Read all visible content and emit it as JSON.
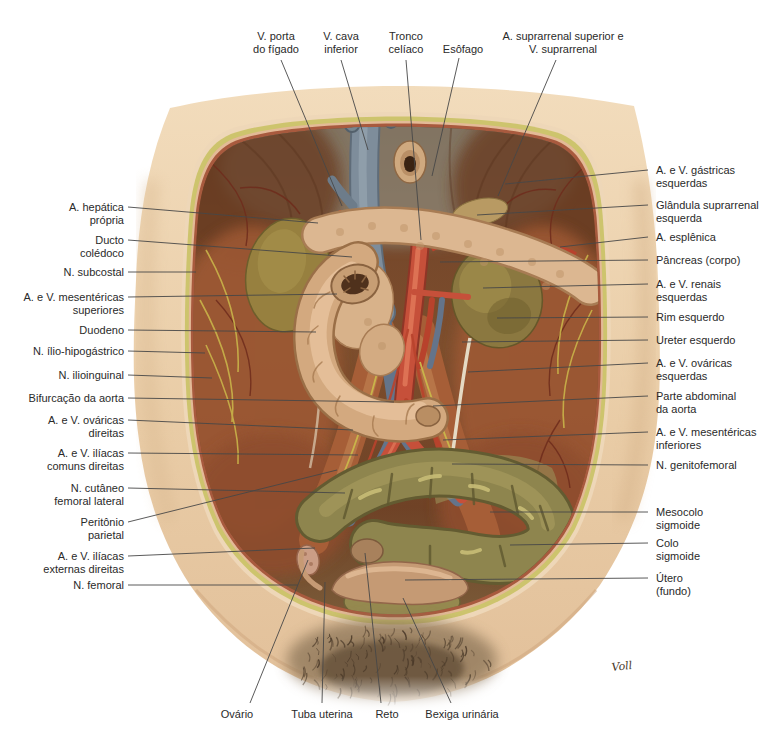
{
  "figure": {
    "signature": "Voll",
    "palette": {
      "background": "#ffffff",
      "label_text": "#2a2a2a",
      "leader_line": "#474747",
      "skin": "#ecd0ac",
      "fat_layer": "#cdc46d",
      "muscle_wall": "#a85a3e",
      "cavity": "#74482a",
      "artery": "#c6503a",
      "vein": "#7e8d9b",
      "nerve": "#c9b44a",
      "pancreas": "#dcb791",
      "duodenum": "#d3a97f",
      "kidney": "#8b7840",
      "colon": "#8e854e",
      "uterus": "#c59a74"
    }
  },
  "labels": {
    "top": [
      {
        "text": "V. porta\ndo fígado"
      },
      {
        "text": "V. cava\ninferior"
      },
      {
        "text": "Tronco\ncelíaco"
      },
      {
        "text": "Esôfago"
      },
      {
        "text": "A. suprarrenal superior e\nV. suprarrenal"
      }
    ],
    "left": [
      {
        "text": "A. hepática\nprópria"
      },
      {
        "text": "Ducto\ncolédoco"
      },
      {
        "text": "N. subcostal"
      },
      {
        "text": "A. e V. mesentéricas\nsuperiores"
      },
      {
        "text": "Duodeno"
      },
      {
        "text": "N. ílio-hipogástrico"
      },
      {
        "text": "N. ilioinguinal"
      },
      {
        "text": "Bifurcação da aorta"
      },
      {
        "text": "A. e V. ováricas\ndireitas"
      },
      {
        "text": "A. e V. ilíacas\ncomuns direitas"
      },
      {
        "text": "N. cutâneo\nfemoral lateral"
      },
      {
        "text": "Peritônio\nparietal"
      },
      {
        "text": "A. e V. ilíacas\nexternas direitas"
      },
      {
        "text": "N. femoral"
      }
    ],
    "right": [
      {
        "text": "A. e V. gástricas\nesquerdas"
      },
      {
        "text": "Glândula suprarrenal\nesquerda"
      },
      {
        "text": "A. esplênica"
      },
      {
        "text": "Pâncreas (corpo)"
      },
      {
        "text": "A. e V. renais\nesquerdas"
      },
      {
        "text": "Rim esquerdo"
      },
      {
        "text": "Ureter esquerdo"
      },
      {
        "text": "A. e V. ováricas\nesquerdas"
      },
      {
        "text": "Parte abdominal\nda aorta"
      },
      {
        "text": "A. e V. mesentéricas\ninferiores"
      },
      {
        "text": "N. genitofemoral"
      },
      {
        "text": "Mesocolo\nsigmoide"
      },
      {
        "text": "Colo\nsigmoide"
      },
      {
        "text": "Útero\n(fundo)"
      }
    ],
    "bottom": [
      {
        "text": "Ovário"
      },
      {
        "text": "Tuba uterina"
      },
      {
        "text": "Reto"
      },
      {
        "text": "Bexiga urinária"
      }
    ]
  }
}
